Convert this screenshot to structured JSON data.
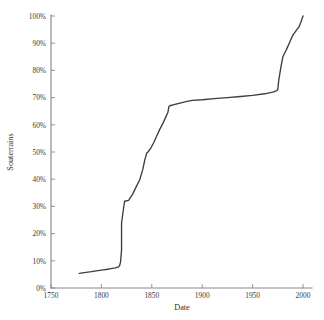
{
  "chart_data": {
    "type": "line",
    "title": "",
    "xlabel": "Date",
    "ylabel": "Souterrains",
    "xlim": [
      1750,
      2000
    ],
    "ylim": [
      0,
      100
    ],
    "grid": false,
    "legend": null,
    "x_ticks": [
      1750,
      1800,
      1850,
      1900,
      1950,
      2000
    ],
    "x_tick_labels": [
      "1750",
      "1800",
      "1850",
      "1900",
      "1950",
      "2000"
    ],
    "y_ticks": [
      0,
      10,
      20,
      30,
      40,
      50,
      60,
      70,
      80,
      90,
      100
    ],
    "y_tick_labels": [
      "0%",
      "10%",
      "20%",
      "30%",
      "40%",
      "50%",
      "60%",
      "70%",
      "80%",
      "90%",
      "100%"
    ],
    "series": [
      {
        "name": "Souterrains",
        "color": "#3d3d3d",
        "x": [
          1778,
          1790,
          1800,
          1808,
          1814,
          1817,
          1818,
          1819,
          1820,
          1820,
          1823,
          1827,
          1831,
          1834,
          1838,
          1841,
          1843,
          1845,
          1846,
          1849,
          1852,
          1855,
          1858,
          1861,
          1864,
          1866,
          1867,
          1868,
          1872,
          1878,
          1885,
          1890,
          1900,
          1912,
          1925,
          1938,
          1950,
          1962,
          1970,
          1974,
          1975,
          1976,
          1978,
          1980,
          1982,
          1984,
          1987,
          1990,
          1993,
          1996,
          1998,
          2000
        ],
        "y": [
          5.4,
          6.0,
          6.6,
          7.0,
          7.4,
          7.8,
          8.2,
          9.5,
          14.0,
          24.0,
          31.9,
          32.2,
          34.5,
          36.8,
          39.8,
          43.5,
          47.0,
          49.6,
          49.9,
          51.4,
          53.5,
          56.0,
          58.4,
          60.5,
          63.0,
          64.6,
          66.8,
          67.0,
          67.4,
          68.0,
          68.6,
          69.0,
          69.2,
          69.6,
          70.0,
          70.4,
          70.8,
          71.4,
          72.0,
          72.6,
          73.0,
          76.5,
          81.0,
          85.0,
          86.5,
          88.0,
          90.5,
          93.0,
          94.5,
          96.0,
          97.8,
          100.0
        ]
      }
    ]
  },
  "axes": {
    "axis_color": "#8a8a8a",
    "line_color": "#3d3d3d"
  }
}
